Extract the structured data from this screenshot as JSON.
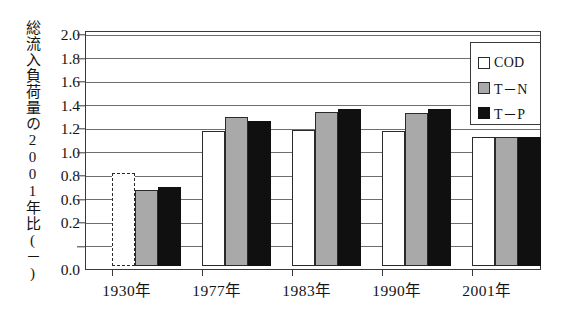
{
  "chart_data": {
    "type": "bar",
    "title": "",
    "xlabel": "",
    "ylabel": "総流入負荷量の2001年比(－)",
    "categories": [
      "1930年",
      "1977年",
      "1983年",
      "1990年",
      "2001年"
    ],
    "series": [
      {
        "name": "COD",
        "color": "#ffffff",
        "values": [
          0.79,
          1.15,
          1.16,
          1.15,
          1.1
        ]
      },
      {
        "name": "T－N",
        "color": "#a9a9a9",
        "values": [
          0.65,
          1.27,
          1.31,
          1.3,
          1.1
        ]
      },
      {
        "name": "T－P",
        "color": "#101010",
        "values": [
          0.67,
          1.23,
          1.34,
          1.34,
          1.1
        ]
      }
    ],
    "series_notes": [
      "1930年 COD bar is drawn with a dashed outline (estimated value)"
    ],
    "ylim": [
      0.0,
      2.0
    ],
    "ytick_labels": [
      "0.0",
      "0.2",
      "0.6",
      "0.8",
      "1.0",
      "1.2",
      "1.4",
      "1.6",
      "1.8",
      "2.0"
    ],
    "ytick_values": [
      0.0,
      0.2,
      0.4,
      0.6,
      0.8,
      1.0,
      1.2,
      1.4,
      1.6,
      1.8,
      2.0
    ],
    "grid": true,
    "grid_axis": "y",
    "legend_position": "top-right",
    "legend_entries": [
      "COD",
      "T－N",
      "T－P"
    ]
  },
  "legend": {
    "items": [
      {
        "label": "COD",
        "swatch": "white-square-icon"
      },
      {
        "label": "T－N",
        "swatch": "gray-square-icon"
      },
      {
        "label": "T－P",
        "swatch": "black-square-icon"
      }
    ]
  },
  "axis": {
    "y_title": "総流入負荷量の2001年比(－)",
    "y_labels": [
      "2.0",
      "1.8",
      "1.6",
      "1.4",
      "1.2",
      "1.0",
      "0.8",
      "0.6",
      "0.2",
      "0.0"
    ],
    "x_labels": [
      "1930年",
      "1977年",
      "1983年",
      "1990年",
      "2001年"
    ]
  },
  "colors": {
    "cod": "#ffffff",
    "tn": "#a9a9a9",
    "tp": "#101010",
    "frame": "#3a3a3a",
    "grid": "#6e6e6e",
    "text": "#141414"
  }
}
